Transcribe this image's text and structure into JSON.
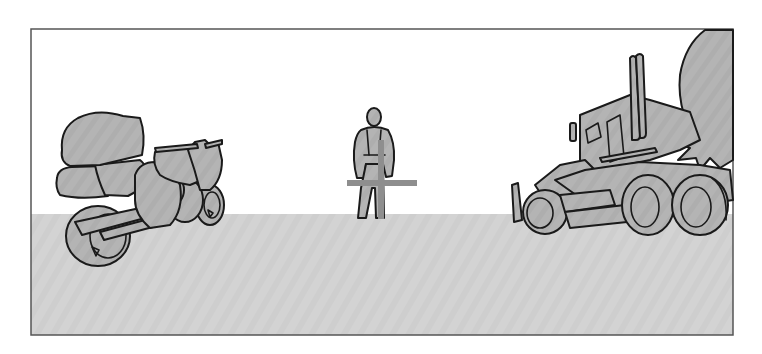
{
  "scene": {
    "description": "Line-art illustration: loaded motorcycle on left, standing person in center with crossing bars, large truck on right",
    "colors": {
      "sky": "#ffffff",
      "ground": "#d3d3d3",
      "object_fill": "#b2b2b2",
      "object_fill_light": "#bdbdbd",
      "outline": "#1a1a1a",
      "frame": "#555555"
    },
    "frame": {
      "x": 31,
      "y": 29,
      "width": 702,
      "height": 306
    },
    "horizon_y": 214,
    "objects": [
      {
        "name": "motorcycle",
        "x_range": [
          55,
          225
        ],
        "y_range": [
          110,
          265
        ]
      },
      {
        "name": "person",
        "x_range": [
          352,
          396
        ],
        "y_range": [
          108,
          219
        ]
      },
      {
        "name": "horizontal-bar",
        "x_range": [
          347,
          417
        ],
        "y_range": [
          180,
          186
        ]
      },
      {
        "name": "vertical-bar",
        "x_range": [
          378,
          384
        ],
        "y_range": [
          140,
          219
        ]
      },
      {
        "name": "truck",
        "x_range": [
          510,
          733
        ],
        "y_range": [
          50,
          235
        ]
      }
    ]
  }
}
